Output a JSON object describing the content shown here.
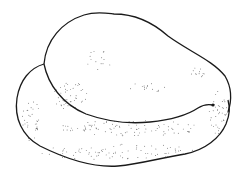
{
  "illustration": {
    "subject": "stippled line drawing of a rounded stone / seed with an overlapping upper lobe",
    "colors": {
      "background": "#ffffff",
      "outline": "#1a1a1a",
      "stipple": "#333333"
    }
  }
}
